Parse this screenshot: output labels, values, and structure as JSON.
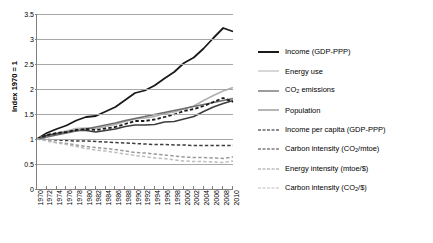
{
  "chart_data": {
    "type": "line",
    "title": "",
    "xlabel": "",
    "ylabel": "Index 1970 = 1",
    "ylim": [
      0,
      3.5
    ],
    "ytick_values": [
      0,
      0.5,
      1,
      1.5,
      2,
      2.5,
      3,
      3.5
    ],
    "ytick_labels": [
      "0",
      "0.5",
      "1",
      "1.5",
      "2",
      "2.5",
      "3",
      "3.5"
    ],
    "grid": true,
    "legend_position": "right",
    "x": [
      1970,
      1972,
      1974,
      1976,
      1978,
      1980,
      1982,
      1984,
      1986,
      1988,
      1990,
      1992,
      1994,
      1996,
      1998,
      2000,
      2002,
      2004,
      2006,
      2008,
      2010
    ],
    "xtick_labels": [
      "1970",
      "1972",
      "1974",
      "1976",
      "1978",
      "1980",
      "1982",
      "1984",
      "1986",
      "1988",
      "1990",
      "1992",
      "1994",
      "1996",
      "1998",
      "2000",
      "2002",
      "2004",
      "2006",
      "2008",
      "2010"
    ],
    "series": [
      {
        "name": "Income (GDP-PPP)",
        "style": "solid",
        "color": "#1a1a1a",
        "width": 1.8,
        "values": [
          1.0,
          1.12,
          1.2,
          1.27,
          1.37,
          1.44,
          1.46,
          1.55,
          1.64,
          1.78,
          1.92,
          1.97,
          2.07,
          2.21,
          2.34,
          2.52,
          2.63,
          2.81,
          3.02,
          3.22,
          3.15
        ]
      },
      {
        "name": "Energy use",
        "style": "solid",
        "color": "#b0b0b0",
        "width": 1.6,
        "values": [
          1.0,
          1.08,
          1.12,
          1.16,
          1.21,
          1.22,
          1.21,
          1.25,
          1.29,
          1.35,
          1.4,
          1.42,
          1.45,
          1.51,
          1.54,
          1.6,
          1.66,
          1.77,
          1.87,
          1.96,
          2.03
        ]
      },
      {
        "name": "CO2 emissions",
        "style": "solid",
        "color": "#3d3d3d",
        "width": 1.6,
        "values": [
          1.0,
          1.07,
          1.1,
          1.13,
          1.17,
          1.17,
          1.14,
          1.17,
          1.2,
          1.25,
          1.28,
          1.28,
          1.29,
          1.34,
          1.35,
          1.4,
          1.45,
          1.55,
          1.64,
          1.71,
          1.77
        ]
      },
      {
        "name": "Population",
        "style": "solid",
        "color": "#6e6e6e",
        "width": 1.6,
        "values": [
          1.0,
          1.04,
          1.08,
          1.12,
          1.16,
          1.2,
          1.24,
          1.28,
          1.32,
          1.37,
          1.41,
          1.45,
          1.49,
          1.53,
          1.57,
          1.61,
          1.65,
          1.69,
          1.73,
          1.77,
          1.81
        ]
      },
      {
        "name": "Income per capita (GDP-PPP)",
        "style": "dashed",
        "color": "#1a1a1a",
        "width": 1.8,
        "values": [
          1.0,
          1.08,
          1.12,
          1.14,
          1.18,
          1.2,
          1.18,
          1.21,
          1.24,
          1.3,
          1.36,
          1.36,
          1.39,
          1.44,
          1.49,
          1.56,
          1.6,
          1.66,
          1.74,
          1.82,
          1.74
        ]
      },
      {
        "name": "Carbon intensity (CO2/mtoe)",
        "style": "dashed",
        "color": "#3d3d3d",
        "width": 1.5,
        "values": [
          1.0,
          0.99,
          0.98,
          0.97,
          0.96,
          0.96,
          0.95,
          0.94,
          0.93,
          0.92,
          0.91,
          0.9,
          0.89,
          0.89,
          0.88,
          0.88,
          0.87,
          0.87,
          0.87,
          0.87,
          0.87
        ]
      },
      {
        "name": "Energy intensity (mtoe/$)",
        "style": "dashed",
        "color": "#9a9a9a",
        "width": 1.5,
        "values": [
          1.0,
          0.97,
          0.93,
          0.91,
          0.88,
          0.85,
          0.83,
          0.81,
          0.79,
          0.76,
          0.73,
          0.72,
          0.7,
          0.68,
          0.66,
          0.64,
          0.63,
          0.63,
          0.62,
          0.61,
          0.64
        ]
      },
      {
        "name": "Carbon intensity (CO2/$)",
        "style": "dashed",
        "color": "#bdbdbd",
        "width": 1.5,
        "values": [
          1.0,
          0.96,
          0.92,
          0.89,
          0.85,
          0.81,
          0.78,
          0.76,
          0.73,
          0.7,
          0.67,
          0.65,
          0.62,
          0.61,
          0.58,
          0.56,
          0.55,
          0.55,
          0.54,
          0.53,
          0.56
        ]
      }
    ]
  },
  "axis": {
    "y_title": "Index 1970 = 1"
  },
  "legend": {
    "items": [
      {
        "label_pre": "Income (GDP-PPP)",
        "label_sub": "",
        "label_post": "",
        "style": "solid",
        "color": "#1a1a1a"
      },
      {
        "label_pre": "Energy use",
        "label_sub": "",
        "label_post": "",
        "style": "solid",
        "color": "#b0b0b0"
      },
      {
        "label_pre": "CO",
        "label_sub": "2",
        "label_post": " emissions",
        "style": "solid",
        "color": "#3d3d3d"
      },
      {
        "label_pre": "Population",
        "label_sub": "",
        "label_post": "",
        "style": "solid",
        "color": "#6e6e6e"
      },
      {
        "label_pre": "Income per capita (GDP-PPP)",
        "label_sub": "",
        "label_post": "",
        "style": "dashed",
        "color": "#1a1a1a"
      },
      {
        "label_pre": "Carbon intensity (CO",
        "label_sub": "2",
        "label_post": "/mtoe)",
        "style": "dashed",
        "color": "#3d3d3d"
      },
      {
        "label_pre": "Energy intensity (mtoe/$)",
        "label_sub": "",
        "label_post": "",
        "style": "dashed",
        "color": "#9a9a9a"
      },
      {
        "label_pre": "Carbon intensity (CO",
        "label_sub": "2",
        "label_post": "/$)",
        "style": "dashed",
        "color": "#bdbdbd"
      }
    ]
  }
}
